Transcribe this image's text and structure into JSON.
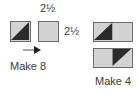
{
  "diagram": {
    "top_dimension": "2½",
    "side_dimension": "2½",
    "left_group": {
      "label": "Make 8",
      "units": [
        {
          "type": "half-square-triangle",
          "dark_half": "bottom-right"
        },
        {
          "type": "plain-square"
        }
      ],
      "arrow": "arrow-right"
    },
    "right_group": {
      "label": "Make 4",
      "units": [
        {
          "type": "flying-unit",
          "dark_half": "left-square-bottom-left"
        },
        {
          "type": "flying-unit",
          "dark_half": "right-square-top-right"
        }
      ]
    }
  },
  "colors": {
    "light": "#d3d3d3",
    "dark": "#2b2b2b",
    "border": "#6b6b6b",
    "text": "#3a3a3a"
  }
}
